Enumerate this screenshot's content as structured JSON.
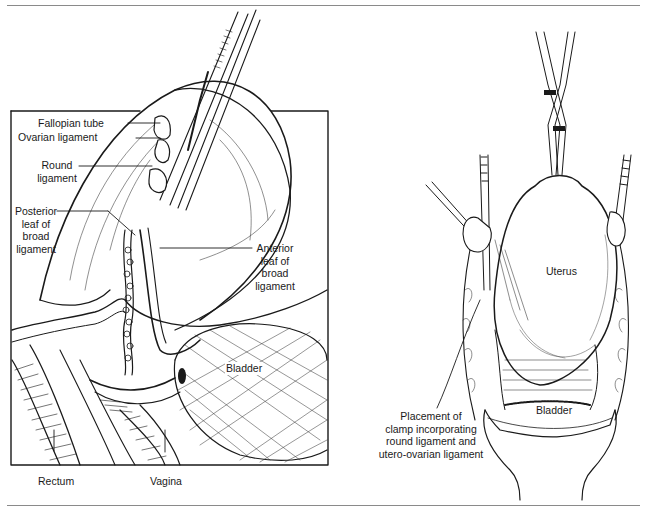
{
  "figure": {
    "left_panel": {
      "labels": {
        "fallopian_tube": "Fallopian tube",
        "ovarian_ligament": "Ovarian ligament",
        "round_ligament_1": "Round",
        "round_ligament_2": "ligament",
        "posterior_1": "Posterior",
        "posterior_2": "leaf of",
        "posterior_3": "broad",
        "posterior_4": "ligament",
        "anterior_1": "Anterior",
        "anterior_2": "leaf of",
        "anterior_3": "broad",
        "anterior_4": "ligament",
        "bladder": "Bladder",
        "rectum": "Rectum",
        "vagina": "Vagina"
      }
    },
    "right_panel": {
      "labels": {
        "uterus": "Uterus",
        "bladder": "Bladder",
        "clamp_1": "Placement of",
        "clamp_2": "clamp incorporating",
        "clamp_3": "round ligament and",
        "clamp_4": "utero-ovarian ligament"
      }
    },
    "colors": {
      "ink": "#1a1a1a",
      "rule": "#8a8a8a",
      "background": "#ffffff"
    }
  }
}
